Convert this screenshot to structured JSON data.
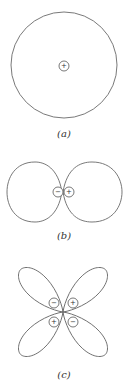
{
  "figures": [
    {
      "id": "a",
      "label": "(a)",
      "description": "s orbital - spherical",
      "signs": [
        {
          "symbol": "+"
        }
      ]
    },
    {
      "id": "b",
      "label": "(b)",
      "description": "p orbital - two lobes",
      "signs": [
        {
          "symbol": "−"
        },
        {
          "symbol": "+"
        }
      ]
    },
    {
      "id": "c",
      "label": "(c)",
      "description": "d orbital - four lobes",
      "signs": [
        {
          "symbol": "−"
        },
        {
          "symbol": "+"
        },
        {
          "symbol": "+"
        },
        {
          "symbol": "−"
        }
      ]
    }
  ],
  "colors": {
    "outline": "#6a6a6a",
    "text": "#333333",
    "background": "#ffffff"
  }
}
